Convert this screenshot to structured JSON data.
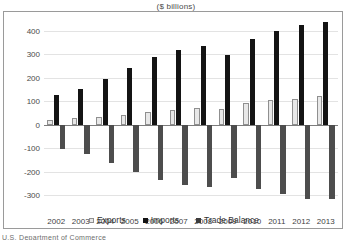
{
  "chart_data": {
    "type": "bar",
    "title": "($ billions)",
    "xlabel": "",
    "ylabel": "",
    "ylim": [
      -300,
      400
    ],
    "yticks": [
      400,
      300,
      200,
      100,
      0,
      -100,
      -200,
      -300
    ],
    "grid": true,
    "legend_position": "bottom",
    "categories": [
      "2002",
      "2003",
      "2004",
      "2005",
      "2006",
      "2007",
      "2008",
      "2009",
      "2010",
      "2011",
      "2012",
      "2013"
    ],
    "series": [
      {
        "name": "Exports",
        "color": "#e8e8e8",
        "values": [
          22,
          28,
          35,
          42,
          55,
          63,
          71,
          69,
          92,
          104,
          111,
          122
        ]
      },
      {
        "name": "Imports",
        "color": "#141414",
        "values": [
          125,
          152,
          196,
          243,
          288,
          321,
          338,
          296,
          365,
          399,
          426,
          440
        ]
      },
      {
        "name": "Trade Balance",
        "color": "#4d4d4d",
        "values": [
          -103,
          -124,
          -162,
          -202,
          -234,
          -258,
          -268,
          -227,
          -273,
          -295,
          -315,
          -318
        ]
      }
    ]
  },
  "footer": {
    "cut_text": "U.S. Department of Commerce"
  }
}
